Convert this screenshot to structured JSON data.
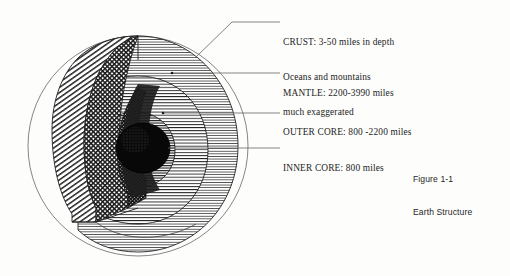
{
  "figure": {
    "caption_id": "Figure 1-1",
    "caption_title": "Earth Structure",
    "diagram_name": "earth-cutaway-sphere"
  },
  "labels": {
    "crust": {
      "line1": "CRUST: 3-50 miles in depth",
      "line2": "Oceans and mountains",
      "line3": "much exaggerated"
    },
    "mantle": {
      "line1": "MANTLE: 2200-3990 miles"
    },
    "outer_core": {
      "line1": "OUTER CORE: 800 -2200 miles"
    },
    "inner_core": {
      "line1": "INNER CORE: 800 miles"
    }
  },
  "diagram": {
    "layers": [
      {
        "name": "crust",
        "fill_style": "horizontal-hatch-fine"
      },
      {
        "name": "mantle",
        "fill_style": "horizontal-hatch"
      },
      {
        "name": "outer-core",
        "fill_style": "horizontal-hatch-dense"
      },
      {
        "name": "inner-core",
        "fill_style": "solid-black"
      },
      {
        "name": "cut-face-crust",
        "fill_style": "diagonal-hatch"
      },
      {
        "name": "cut-face-mantle",
        "fill_style": "cross-hatch"
      },
      {
        "name": "cut-face-core",
        "fill_style": "cross-hatch-dense"
      }
    ],
    "sphere": {
      "cx": 138,
      "cy": 146,
      "r": 110
    }
  },
  "colors": {
    "ink": "#1a1a1a",
    "paper": "#fdfdfc",
    "leader": "#555555"
  }
}
